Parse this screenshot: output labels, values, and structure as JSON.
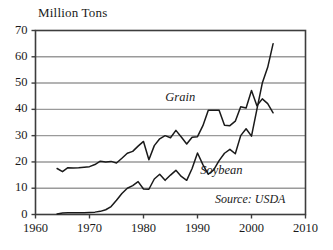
{
  "chart_data": {
    "type": "line",
    "title": "Million Tons",
    "xlabel": "",
    "ylabel": "Million Tons",
    "xlim": [
      1960,
      2010
    ],
    "ylim": [
      0,
      70
    ],
    "xticks": [
      "1960",
      "1970",
      "1980",
      "1990",
      "2000",
      "2010"
    ],
    "yticks": [
      "0",
      "10",
      "20",
      "30",
      "40",
      "50",
      "60",
      "70"
    ],
    "grid": true,
    "legend_position": "inline-annotation",
    "source": "Source: USDA",
    "series": [
      {
        "name": "Grain",
        "label": "Grain",
        "color": "#1a1a1a",
        "x": [
          1964,
          1965,
          1966,
          1967,
          1968,
          1969,
          1970,
          1971,
          1972,
          1973,
          1974,
          1975,
          1976,
          1977,
          1978,
          1979,
          1980,
          1981,
          1982,
          1983,
          1984,
          1985,
          1986,
          1987,
          1988,
          1989,
          1990,
          1991,
          1992,
          1993,
          1994,
          1995,
          1996,
          1997,
          1998,
          1999,
          2000,
          2001,
          2002,
          2003,
          2004
        ],
        "values": [
          17.5,
          16.3,
          17.8,
          17.7,
          17.8,
          18.0,
          18.2,
          19.0,
          20.3,
          20.0,
          20.2,
          19.6,
          21.4,
          23.3,
          24.0,
          26.0,
          27.8,
          20.8,
          26.2,
          28.8,
          30.0,
          29.2,
          32.0,
          29.5,
          26.8,
          29.4,
          29.6,
          33.8,
          39.7,
          39.7,
          39.7,
          34.0,
          33.8,
          35.5,
          41.0,
          40.5,
          47.2,
          41.4,
          44.0,
          42.2,
          38.7
        ],
        "values_note": "Grain imports; line continues through early 2000s around 42-48"
      },
      {
        "name": "Soybean",
        "label": "Soybean",
        "color": "#1a1a1a",
        "x": [
          1964,
          1965,
          1966,
          1967,
          1968,
          1969,
          1970,
          1971,
          1972,
          1973,
          1974,
          1975,
          1976,
          1977,
          1978,
          1979,
          1980,
          1981,
          1982,
          1983,
          1984,
          1985,
          1986,
          1987,
          1988,
          1989,
          1990,
          1991,
          1992,
          1993,
          1994,
          1995,
          1996,
          1997,
          1998,
          1999,
          2000,
          2001,
          2002,
          2003,
          2004
        ],
        "values": [
          0.2,
          0.6,
          0.7,
          0.7,
          0.7,
          0.7,
          0.8,
          0.9,
          1.2,
          1.8,
          3.0,
          5.4,
          8.0,
          10.0,
          11.0,
          12.5,
          9.7,
          9.6,
          13.5,
          15.3,
          13.0,
          15.0,
          16.8,
          14.5,
          13.0,
          17.5,
          23.4,
          19.0,
          15.3,
          17.0,
          20.5,
          23.3,
          24.8,
          23.1,
          30.0,
          32.6,
          29.8,
          40.0,
          50.0,
          56.0,
          65.0
        ],
        "values_note": "Soybean imports rising sharply after 1997"
      }
    ],
    "annotations": [
      {
        "text": "Grain",
        "x": 1987,
        "y": 44
      },
      {
        "text": "Soybean",
        "x": 1990.5,
        "y": 16
      },
      {
        "text": "Source: USDA",
        "x": 2001,
        "y": 5
      }
    ]
  },
  "colors": {
    "line": "#1a1a1a",
    "grid": "#9a9a9a",
    "axis": "#4a4a4a",
    "background": "#ffffff",
    "text": "#1a1a1a"
  }
}
